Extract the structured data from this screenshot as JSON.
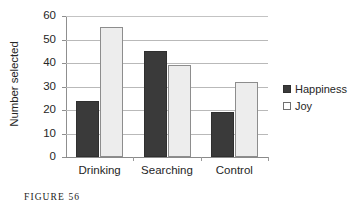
{
  "caption": "FIGURE 56",
  "legend": {
    "position": "right",
    "entries": [
      {
        "label": "Happiness",
        "marker": "filled-square",
        "color": "#3a3a3a"
      },
      {
        "label": "Joy",
        "marker": "open-square",
        "color": "#ffffff"
      }
    ]
  },
  "chart_data": {
    "type": "bar",
    "title": "",
    "subtitle": "",
    "xlabel": "",
    "ylabel": "Number selected",
    "categories": [
      "Drinking",
      "Searching",
      "Control"
    ],
    "series": [
      {
        "name": "Happiness",
        "values": [
          24,
          45,
          19
        ],
        "color": "#3a3a3a"
      },
      {
        "name": "Joy",
        "values": [
          55.5,
          39,
          32
        ],
        "color": "#ededed"
      }
    ],
    "ylim": [
      0,
      60
    ],
    "ytick_step": 10,
    "yticks": [
      "0",
      "10",
      "20",
      "30",
      "40",
      "50",
      "60"
    ],
    "grid": "horizontal",
    "legend_position": "right",
    "bar_mode": "grouped"
  }
}
